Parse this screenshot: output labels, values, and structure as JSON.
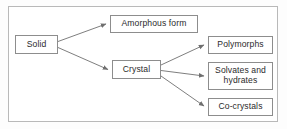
{
  "diagram": {
    "type": "flowchart",
    "orientation": "left-to-right",
    "frame": {
      "border_color": "#b9b9b9",
      "background": "#ffffff"
    },
    "style": {
      "node_border_color": "#8d8d8d",
      "node_background": "#ffffff",
      "text_color": "#2b2b2b",
      "edge_color": "#6f6f6f"
    },
    "nodes": [
      {
        "id": "solid",
        "label": "Solid"
      },
      {
        "id": "amorphous",
        "label": "Amorphous form"
      },
      {
        "id": "crystal",
        "label": "Crystal"
      },
      {
        "id": "polymorphs",
        "label": "Polymorphs"
      },
      {
        "id": "solvates",
        "label": "Solvates and\nhydrates"
      },
      {
        "id": "cocrystals",
        "label": "Co-crystals"
      }
    ],
    "edges": [
      {
        "from": "solid",
        "to": "amorphous",
        "arrowhead": "solid-triangle"
      },
      {
        "from": "solid",
        "to": "crystal",
        "arrowhead": "solid-triangle"
      },
      {
        "from": "crystal",
        "to": "polymorphs",
        "arrowhead": "solid-triangle"
      },
      {
        "from": "crystal",
        "to": "solvates",
        "arrowhead": "solid-triangle"
      },
      {
        "from": "crystal",
        "to": "cocrystals",
        "arrowhead": "solid-triangle"
      }
    ]
  }
}
